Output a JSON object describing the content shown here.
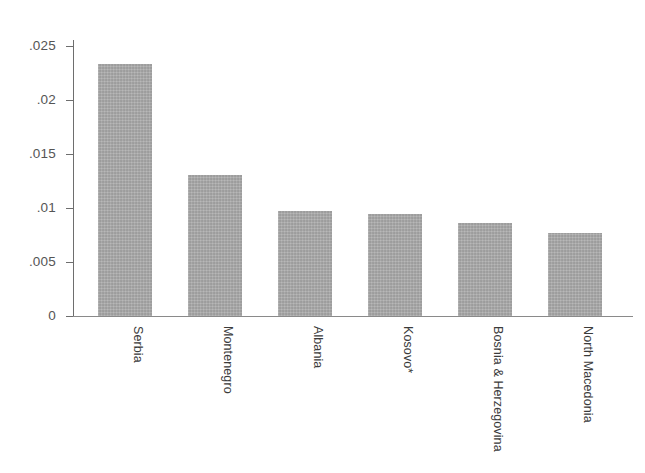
{
  "chart_data": {
    "type": "bar",
    "title": "",
    "subtitle": "",
    "xlabel": "",
    "ylabel": "",
    "categories": [
      "Serbia",
      "Montenegro",
      "Albania",
      "Kosovo*",
      "Bosnia & Herzegovina",
      "North Macedonia"
    ],
    "values": [
      0.0233,
      0.0131,
      0.0097,
      0.0094,
      0.0086,
      0.0077
    ],
    "ylim": [
      0,
      0.025
    ],
    "ytick_values": [
      0,
      0.005,
      0.01,
      0.015,
      0.02,
      0.025
    ],
    "ytick_labels": [
      "0",
      ".005",
      ".01",
      ".015",
      ".02",
      ".025"
    ],
    "grid": false,
    "legend": false,
    "legend_position": "none",
    "annotations": [],
    "bar_color": "#a9a9a9",
    "axis_color": "#6e6e6e",
    "background_color": "#ffffff",
    "xtick_label_rotation": 90
  }
}
